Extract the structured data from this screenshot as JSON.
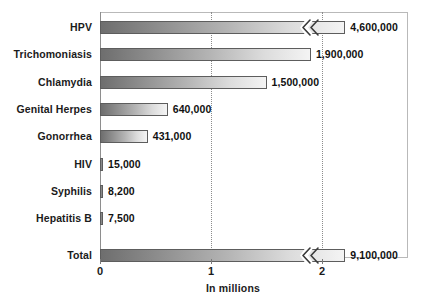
{
  "chart_data": {
    "type": "bar",
    "orientation": "horizontal",
    "title": "",
    "xlabel": "In millions",
    "ylabel": "",
    "categories": [
      "HPV",
      "Trichomoniasis",
      "Chlamydia",
      "Genital Herpes",
      "Gonorrhea",
      "HIV",
      "Syphilis",
      "Hepatitis B",
      "Total"
    ],
    "values": [
      4600000,
      1900000,
      1500000,
      640000,
      431000,
      15000,
      8200,
      7500,
      9100000
    ],
    "value_labels": [
      "4,600,000",
      "1,900,000",
      "1,500,000",
      "640,000",
      "431,000",
      "15,000",
      "8,200",
      "7,500",
      "9,100,000"
    ],
    "units": "millions",
    "xlim": [
      0,
      2.78
    ],
    "xtick_labels": [
      "0",
      "1",
      "2"
    ],
    "xtick_values": [
      0,
      1,
      2
    ],
    "grid": "vertical-dotted",
    "legend": "none",
    "axis_break": {
      "present": true,
      "applies_to": [
        "HPV",
        "Total"
      ],
      "note": "zigzag break symbol indicates bar truncated beyond axis range"
    },
    "bar_style": {
      "fill": "gradient",
      "gradient_from": "#6e6e6e",
      "gradient_to": "#f4f4f4",
      "border": "#5d5d5d"
    },
    "bars": [
      {
        "label": "HPV",
        "value_label": "4,600,000",
        "value": 4600000,
        "plot_fraction": 2.21,
        "truncated": true,
        "sliver": false
      },
      {
        "label": "Trichomoniasis",
        "value_label": "1,900,000",
        "value": 1900000,
        "plot_fraction": 1.9,
        "truncated": false,
        "sliver": false
      },
      {
        "label": "Chlamydia",
        "value_label": "1,500,000",
        "value": 1500000,
        "plot_fraction": 1.5,
        "truncated": false,
        "sliver": false
      },
      {
        "label": "Genital Herpes",
        "value_label": "640,000",
        "value": 640000,
        "plot_fraction": 0.61,
        "truncated": false,
        "sliver": false
      },
      {
        "label": "Gonorrhea",
        "value_label": "431,000",
        "value": 431000,
        "plot_fraction": 0.43,
        "truncated": false,
        "sliver": false
      },
      {
        "label": "HIV",
        "value_label": "15,000",
        "value": 15000,
        "plot_fraction": 0.022,
        "truncated": false,
        "sliver": true
      },
      {
        "label": "Syphilis",
        "value_label": "8,200",
        "value": 8200,
        "plot_fraction": 0.02,
        "truncated": false,
        "sliver": true
      },
      {
        "label": "Hepatitis B",
        "value_label": "7,500",
        "value": 7500,
        "plot_fraction": 0.02,
        "truncated": false,
        "sliver": true
      },
      {
        "label": "Total",
        "value_label": "9,100,000",
        "value": 9100000,
        "plot_fraction": 2.21,
        "truncated": true,
        "sliver": false
      }
    ]
  },
  "colors": {
    "background": "#ffffff",
    "text": "#1b1b1b",
    "frame": "#b9b9b9",
    "gridline": "#8c8c8c",
    "bar_dark": "#6e6e6e",
    "bar_light": "#f4f4f4",
    "bar_border": "#5d5d5d"
  }
}
